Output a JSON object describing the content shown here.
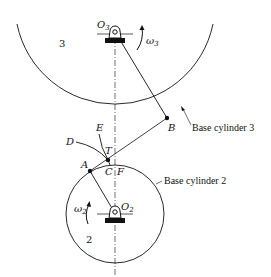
{
  "diagram": {
    "type": "involute gear tooth contact diagram",
    "bodies": [
      {
        "id": "3",
        "label": "3",
        "pivot": "O3",
        "angular_velocity": "ω3",
        "base_circle_label": "Base cylinder 3"
      },
      {
        "id": "2",
        "label": "2",
        "pivot": "O2",
        "angular_velocity": "ω2",
        "base_circle_label": "Base cylinder 2"
      }
    ],
    "points": {
      "O3": {
        "main": "O",
        "sub": "3"
      },
      "O2": {
        "main": "O",
        "sub": "2"
      },
      "A": "A",
      "B": "B",
      "C": "C",
      "D": "D",
      "E": "E",
      "F": "F",
      "T": "T"
    },
    "omega3": {
      "main": "ω",
      "sub": "3"
    },
    "omega2": {
      "main": "ω",
      "sub": "2"
    },
    "body3_number": "3",
    "body2_number": "2",
    "labels": {
      "base_cylinder_3": "Base cylinder 3",
      "base_cylinder_2": "Base cylinder 2"
    },
    "colors": {
      "ink": "#111111",
      "background": "#ffffff"
    }
  }
}
